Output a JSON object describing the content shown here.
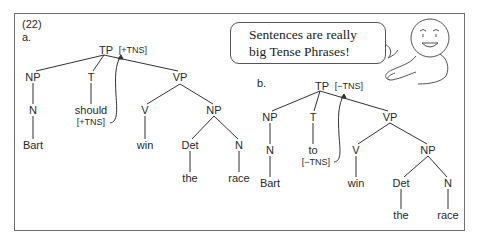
{
  "example_number": "(22)",
  "speech_bubble": {
    "line1": "Sentences are really",
    "line2": "big Tense Phrases!"
  },
  "character": "smiley-face-cartoon",
  "trees": [
    {
      "label": "a.",
      "root": {
        "cat": "TP",
        "feature": "[+TNS]"
      },
      "nodes": {
        "np_subj": "NP",
        "n_subj": "N",
        "subj_word": "Bart",
        "t": "T",
        "t_word": "should",
        "t_feature": "[+TNS]",
        "vp": "VP",
        "v": "V",
        "v_word": "win",
        "np_obj": "NP",
        "det": "Det",
        "det_word": "the",
        "n_obj": "N",
        "obj_word": "race"
      }
    },
    {
      "label": "b.",
      "root": {
        "cat": "TP",
        "feature": "[−TNS]"
      },
      "nodes": {
        "np_subj": "NP",
        "n_subj": "N",
        "subj_word": "Bart",
        "t": "T",
        "t_word": "to",
        "t_feature": "[−TNS]",
        "vp": "VP",
        "v": "V",
        "v_word": "win",
        "np_obj": "NP",
        "det": "Det",
        "det_word": "the",
        "n_obj": "N",
        "obj_word": "race"
      }
    }
  ]
}
